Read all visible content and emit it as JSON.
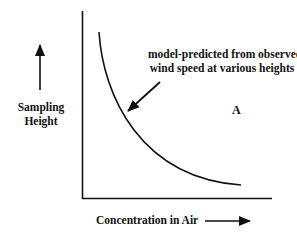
{
  "diagram": {
    "y_axis_label": "Sampling Height",
    "x_axis_label": "Concentration in Air",
    "curve_annotation": "model-predicted from observed wind speed at various heights",
    "curve_annotation_line1": "model-predicted from observed",
    "curve_annotation_line2": "wind speed at various heights",
    "region_label": "A",
    "colors": {
      "stroke": "#111111",
      "background": "#ffffff"
    },
    "elements": [
      "vertical axis",
      "horizontal axis",
      "decreasing curve",
      "up arrow beside y-axis label",
      "right arrow beside x-axis label",
      "pointer arrow from annotation to curve"
    ]
  }
}
